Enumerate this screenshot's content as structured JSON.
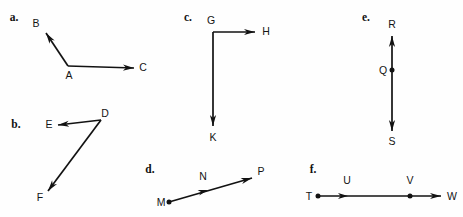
{
  "figure": {
    "background_color": "#fefefe",
    "ink_color": "#121212",
    "width": 463,
    "height": 217
  },
  "panels": [
    {
      "id": "a",
      "letter": "a.",
      "letter_pos": {
        "x": 14,
        "y": 21
      },
      "description": "Two rays with common endpoint A forming an angle",
      "vertex": "A",
      "points": [
        {
          "label": "B",
          "x": 36,
          "y": 27,
          "anchor": "middle",
          "has_dot": false
        },
        {
          "label": "A",
          "x": 69,
          "y": 79,
          "anchor": "middle",
          "has_dot": false
        },
        {
          "label": "C",
          "x": 143,
          "y": 71,
          "anchor": "middle",
          "has_dot": false
        }
      ],
      "segments": [
        {
          "from": "A",
          "to": "B",
          "x1": 68,
          "y1": 66,
          "x2": 46,
          "y2": 33,
          "arrow_end": true
        },
        {
          "from": "A",
          "to": "C",
          "x1": 68,
          "y1": 66,
          "x2": 134,
          "y2": 68,
          "arrow_end": true
        }
      ]
    },
    {
      "id": "b",
      "letter": "b.",
      "letter_pos": {
        "x": 16,
        "y": 128
      },
      "description": "Two rays from common endpoint D, one to E and one to F",
      "vertex": "D",
      "points": [
        {
          "label": "E",
          "x": 49,
          "y": 128,
          "anchor": "middle",
          "has_dot": false
        },
        {
          "label": "D",
          "x": 105,
          "y": 117,
          "anchor": "middle",
          "has_dot": false
        },
        {
          "label": "F",
          "x": 40,
          "y": 201,
          "anchor": "middle",
          "has_dot": false
        }
      ],
      "segments": [
        {
          "from": "D",
          "to": "E",
          "x1": 101,
          "y1": 120,
          "x2": 58,
          "y2": 125,
          "arrow_end": true
        },
        {
          "from": "D",
          "to": "F",
          "x1": 101,
          "y1": 120,
          "x2": 48,
          "y2": 191,
          "arrow_end": true
        }
      ]
    },
    {
      "id": "c",
      "letter": "c.",
      "letter_pos": {
        "x": 188,
        "y": 21
      },
      "description": "Two perpendicular rays from common endpoint G, one to H and one to K",
      "vertex": "G",
      "points": [
        {
          "label": "G",
          "x": 211,
          "y": 24,
          "anchor": "middle",
          "has_dot": false
        },
        {
          "label": "H",
          "x": 266,
          "y": 35,
          "anchor": "middle",
          "has_dot": false
        },
        {
          "label": "K",
          "x": 213,
          "y": 141,
          "anchor": "middle",
          "has_dot": false
        }
      ],
      "segments": [
        {
          "from": "G",
          "to": "H",
          "x1": 213,
          "y1": 32,
          "x2": 255,
          "y2": 32,
          "arrow_end": true
        },
        {
          "from": "G",
          "to": "K",
          "x1": 213,
          "y1": 32,
          "x2": 213,
          "y2": 126,
          "arrow_end": true
        }
      ]
    },
    {
      "id": "d",
      "letter": "d.",
      "letter_pos": {
        "x": 150,
        "y": 173
      },
      "description": "Ray from endpoint M through N toward P",
      "vertex": "M",
      "points": [
        {
          "label": "M",
          "x": 161,
          "y": 206,
          "anchor": "middle",
          "has_dot": true,
          "dot_x": 169,
          "dot_y": 202
        },
        {
          "label": "N",
          "x": 203,
          "y": 180,
          "anchor": "middle",
          "has_dot": false
        },
        {
          "label": "P",
          "x": 261,
          "y": 175,
          "anchor": "middle",
          "has_dot": false
        }
      ],
      "segments": [
        {
          "from": "M",
          "to": "P",
          "x1": 169,
          "y1": 202,
          "x2": 252,
          "y2": 178,
          "arrow_end": true,
          "mid_arrow": {
            "x": 208,
            "y": 190,
            "angle": -16
          }
        }
      ]
    },
    {
      "id": "e",
      "letter": "e.",
      "letter_pos": {
        "x": 366,
        "y": 21
      },
      "description": "Opposite rays QR and QS forming a line through point Q",
      "vertex": "Q",
      "points": [
        {
          "label": "R",
          "x": 392,
          "y": 28,
          "anchor": "middle",
          "has_dot": false
        },
        {
          "label": "Q",
          "x": 383,
          "y": 74,
          "anchor": "middle",
          "has_dot": true,
          "dot_x": 392,
          "dot_y": 70
        },
        {
          "label": "S",
          "x": 392,
          "y": 145,
          "anchor": "middle",
          "has_dot": false
        }
      ],
      "segments": [
        {
          "from": "Q",
          "to": "R",
          "x1": 392,
          "y1": 70,
          "x2": 392,
          "y2": 36,
          "arrow_end": true
        },
        {
          "from": "Q",
          "to": "S",
          "x1": 392,
          "y1": 70,
          "x2": 392,
          "y2": 131,
          "arrow_end": true
        }
      ]
    },
    {
      "id": "f",
      "letter": "f.",
      "letter_pos": {
        "x": 313,
        "y": 173
      },
      "description": "Ray from endpoint T through U and V toward W",
      "vertex": "T",
      "points": [
        {
          "label": "T",
          "x": 309,
          "y": 200,
          "anchor": "middle",
          "has_dot": true,
          "dot_x": 318,
          "dot_y": 196
        },
        {
          "label": "U",
          "x": 347,
          "y": 184,
          "anchor": "middle",
          "has_dot": false
        },
        {
          "label": "V",
          "x": 410,
          "y": 184,
          "anchor": "middle",
          "has_dot": true,
          "dot_x": 410,
          "dot_y": 196
        },
        {
          "label": "W",
          "x": 452,
          "y": 200,
          "anchor": "middle",
          "has_dot": false
        }
      ],
      "segments": [
        {
          "from": "T",
          "to": "W",
          "x1": 318,
          "y1": 196,
          "x2": 441,
          "y2": 196,
          "arrow_end": true,
          "mid_arrow": {
            "x": 348,
            "y": 196,
            "angle": 0
          }
        }
      ]
    }
  ]
}
